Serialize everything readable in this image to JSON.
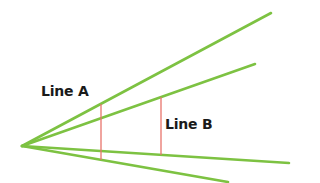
{
  "diagram": {
    "background": "#ffffff",
    "ray_color": "#7dc242",
    "measure_color": "#e8736b",
    "vertex": {
      "x": 22,
      "y": 146
    },
    "rays": [
      {
        "name": "ray-1",
        "end": {
          "x": 271,
          "y": 13
        }
      },
      {
        "name": "ray-2",
        "end": {
          "x": 255,
          "y": 64
        }
      },
      {
        "name": "ray-3",
        "end": {
          "x": 289,
          "y": 163
        }
      },
      {
        "name": "ray-4",
        "end": {
          "x": 228,
          "y": 182
        }
      }
    ],
    "segments": [
      {
        "name": "line-a",
        "label": "Line A",
        "x": 101,
        "y1": 104,
        "y2": 160
      },
      {
        "name": "line-b",
        "label": "Line B",
        "x": 161,
        "y1": 97,
        "y2": 155
      }
    ]
  },
  "labels": {
    "line_a": "Line A",
    "line_b": "Line B"
  }
}
